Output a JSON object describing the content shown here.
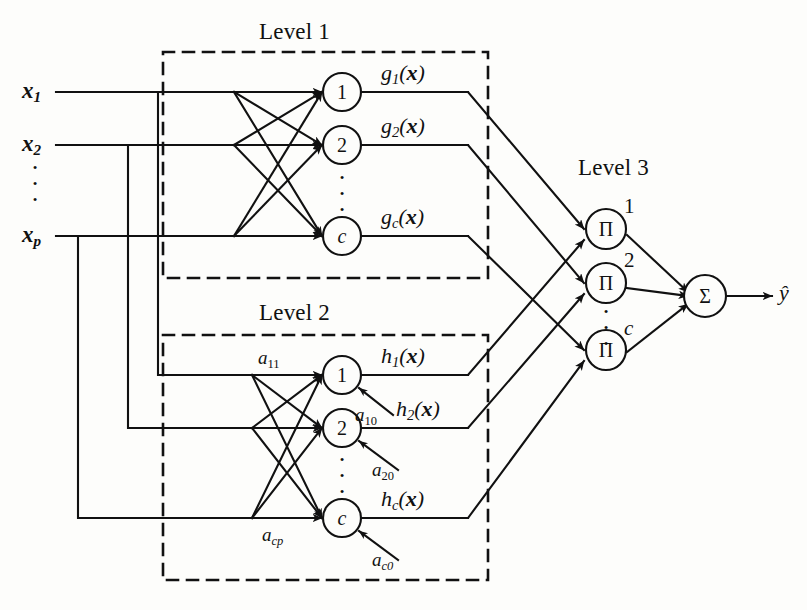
{
  "figure": {
    "background_color": "#fdfdfb",
    "line_color": "#111111"
  },
  "levels": [
    {
      "id": "level1",
      "label": "Level 1"
    },
    {
      "id": "level2",
      "label": "Level 2"
    },
    {
      "id": "level3",
      "label": "Level 3"
    }
  ],
  "inputs": [
    {
      "id": "x1",
      "base": "x",
      "sub": "1"
    },
    {
      "id": "x2",
      "base": "x",
      "sub": "2"
    },
    {
      "id": "xp",
      "base": "x",
      "sub": "p"
    }
  ],
  "input_dots": "·",
  "level1": {
    "label": "Level 1",
    "nodes": [
      {
        "id": "g1",
        "label": "1"
      },
      {
        "id": "g2",
        "label": "2"
      },
      {
        "id": "gc",
        "label": "c"
      }
    ],
    "outputs": [
      {
        "id": "g1out",
        "base": "g",
        "sub": "1",
        "arg": "x"
      },
      {
        "id": "g2out",
        "base": "g",
        "sub": "2",
        "arg": "x"
      },
      {
        "id": "gcout",
        "base": "g",
        "sub": "c",
        "arg": "x"
      }
    ]
  },
  "level2": {
    "label": "Level 2",
    "nodes": [
      {
        "id": "h1",
        "label": "1"
      },
      {
        "id": "h2",
        "label": "2"
      },
      {
        "id": "hc",
        "label": "c"
      }
    ],
    "outputs": [
      {
        "id": "h1out",
        "base": "h",
        "sub": "1",
        "arg": "x"
      },
      {
        "id": "h2out",
        "base": "h",
        "sub": "2",
        "arg": "x"
      },
      {
        "id": "hcout",
        "base": "h",
        "sub": "c",
        "arg": "x"
      }
    ],
    "weights": [
      {
        "id": "a11",
        "base": "a",
        "sub": "11"
      },
      {
        "id": "acp",
        "base": "a",
        "sub": "cp"
      }
    ],
    "biases": [
      {
        "id": "a10",
        "base": "a",
        "sub": "10"
      },
      {
        "id": "a20",
        "base": "a",
        "sub": "20"
      },
      {
        "id": "ac0",
        "base": "a",
        "sub": "c0"
      }
    ]
  },
  "level3": {
    "label": "Level 3",
    "product_symbol": "Π",
    "sum_symbol": "Σ",
    "nodes": [
      {
        "id": "p1",
        "symbol": "Π",
        "index": "1"
      },
      {
        "id": "p2",
        "symbol": "Π",
        "index": "2"
      },
      {
        "id": "pc",
        "symbol": "Π",
        "index": "c"
      }
    ],
    "summation": {
      "id": "sum",
      "symbol": "Σ"
    }
  },
  "output": {
    "id": "yhat",
    "label": "ŷ"
  }
}
